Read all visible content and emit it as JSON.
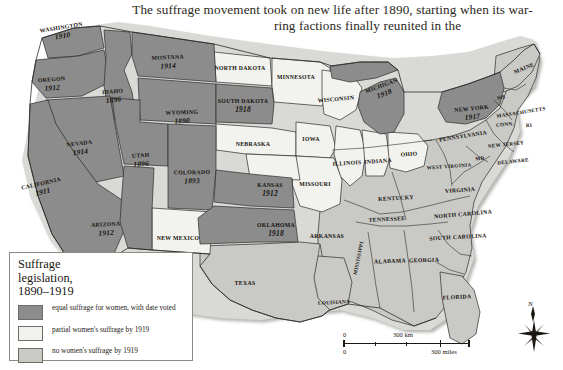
{
  "page": {
    "body_text_line1": "The suffrage movement took on new life after 1890, starting when its war-",
    "body_text_line2": "ring factions finally reunited in the"
  },
  "legend": {
    "title_line1": "Suffrage",
    "title_line2": "legislation,",
    "title_line3": "1890–1919",
    "items": [
      {
        "label": "equal suffrage for women, with date voted",
        "color": "#8c8c8c"
      },
      {
        "label": "partial women's suffrage by 1919",
        "color": "#f2f2ee"
      },
      {
        "label": "no women's suffrage by 1919",
        "color": "#c9c9c6"
      }
    ]
  },
  "scale_bar": {
    "km_zero": "0",
    "km_max": "300 km",
    "miles_zero": "0",
    "miles_max": "300 miles"
  },
  "compass": {
    "north_label": "N"
  },
  "colors": {
    "equal_suffrage": "#8c8c8c",
    "partial_suffrage": "#f2f2ee",
    "no_suffrage": "#c9c9c6",
    "border": "#2b2b2b",
    "ocean": "#ffffff",
    "text": "#16120d"
  },
  "map": {
    "title": "Woman suffrage legislation by state, 1890-1919",
    "states": [
      {
        "name": "WASHINGTON",
        "year": "1910",
        "category": "equal",
        "x": 62,
        "y": 32,
        "rot": -9,
        "size": "sm"
      },
      {
        "name": "OREGON",
        "year": "1912",
        "category": "equal",
        "x": 52,
        "y": 84,
        "rot": -4,
        "size": "sm"
      },
      {
        "name": "IDAHO",
        "year": "1896",
        "category": "equal",
        "x": 113,
        "y": 96,
        "rot": -6,
        "size": "sm"
      },
      {
        "name": "MONTANA",
        "year": "1914",
        "category": "equal",
        "x": 168,
        "y": 62,
        "rot": -3,
        "size": "sm"
      },
      {
        "name": "WYOMING",
        "year": "1890",
        "category": "equal",
        "x": 182,
        "y": 117,
        "rot": -2,
        "size": "sm"
      },
      {
        "name": "NEVADA",
        "year": "1914",
        "category": "equal",
        "x": 80,
        "y": 148,
        "rot": -7,
        "size": "sm"
      },
      {
        "name": "UTAH",
        "year": "1896",
        "category": "equal",
        "x": 141,
        "y": 160,
        "rot": -3,
        "size": "sm"
      },
      {
        "name": "CALIFORNIA",
        "year": "1911",
        "category": "equal",
        "x": 42,
        "y": 188,
        "rot": -13,
        "size": "sm"
      },
      {
        "name": "ARIZONA",
        "year": "1912",
        "category": "equal",
        "x": 106,
        "y": 229,
        "rot": -3,
        "size": "sm"
      },
      {
        "name": "COLORADO",
        "year": "1893",
        "category": "equal",
        "x": 192,
        "y": 177,
        "rot": -1,
        "size": "sm"
      },
      {
        "name": "SOUTH DAKOTA",
        "year": "1918",
        "category": "equal",
        "x": 243,
        "y": 106,
        "rot": 0,
        "size": "sm"
      },
      {
        "name": "KANSAS",
        "year": "1912",
        "category": "equal",
        "x": 270,
        "y": 190,
        "rot": 0,
        "size": "sm"
      },
      {
        "name": "OKLAHOMA",
        "year": "1918",
        "category": "equal",
        "x": 276,
        "y": 230,
        "rot": 0,
        "size": "sm"
      },
      {
        "name": "MICHIGAN",
        "year": "1918",
        "category": "equal",
        "x": 383,
        "y": 90,
        "rot": -20,
        "size": "sm"
      },
      {
        "name": "NEW YORK",
        "year": "1917",
        "category": "equal",
        "x": 472,
        "y": 113,
        "rot": -6,
        "size": "sm"
      },
      {
        "name": "NORTH DAKOTA",
        "year": "",
        "category": "partial",
        "x": 240,
        "y": 68,
        "rot": 0,
        "size": "sm"
      },
      {
        "name": "MINNESOTA",
        "year": "",
        "category": "partial",
        "x": 296,
        "y": 77,
        "rot": 0,
        "size": "sm"
      },
      {
        "name": "WISCONSIN",
        "year": "",
        "category": "partial",
        "x": 336,
        "y": 99,
        "rot": -5,
        "size": "sm"
      },
      {
        "name": "NEBRASKA",
        "year": "",
        "category": "partial",
        "x": 253,
        "y": 144,
        "rot": 0,
        "size": "sm"
      },
      {
        "name": "IOWA",
        "year": "",
        "category": "partial",
        "x": 311,
        "y": 139,
        "rot": 0,
        "size": "sm"
      },
      {
        "name": "ILLINOIS",
        "year": "",
        "category": "partial",
        "x": 347,
        "y": 163,
        "rot": -4,
        "size": "sm"
      },
      {
        "name": "INDIANA",
        "year": "",
        "category": "partial",
        "x": 378,
        "y": 161,
        "rot": -4,
        "size": "sm"
      },
      {
        "name": "OHIO",
        "year": "",
        "category": "partial",
        "x": 409,
        "y": 154,
        "rot": -4,
        "size": "sm"
      },
      {
        "name": "MISSOURI",
        "year": "",
        "category": "partial",
        "x": 315,
        "y": 184,
        "rot": 0,
        "size": "sm"
      },
      {
        "name": "NEW MEXICO",
        "year": "",
        "category": "partial",
        "x": 178,
        "y": 238,
        "rot": 0,
        "size": "sm"
      },
      {
        "name": "MAINE",
        "year": "",
        "category": "no",
        "x": 524,
        "y": 68,
        "rot": -22,
        "size": "sm"
      },
      {
        "name": "NH",
        "year": "",
        "category": "no",
        "x": 501,
        "y": 97,
        "rot": -15,
        "size": "xs"
      },
      {
        "name": "MASSACHUSETTS",
        "year": "",
        "category": "no",
        "x": 521,
        "y": 112,
        "rot": -9,
        "size": "xs"
      },
      {
        "name": "CONN.",
        "year": "",
        "category": "no",
        "x": 505,
        "y": 124,
        "rot": -6,
        "size": "xs"
      },
      {
        "name": "RI",
        "year": "",
        "category": "no",
        "x": 529,
        "y": 125,
        "rot": -6,
        "size": "xs"
      },
      {
        "name": "PENNSYLVANIA",
        "year": "",
        "category": "no",
        "x": 463,
        "y": 136,
        "rot": -9,
        "size": "sm"
      },
      {
        "name": "NEW JERSEY",
        "year": "",
        "category": "no",
        "x": 506,
        "y": 144,
        "rot": -6,
        "size": "xs"
      },
      {
        "name": "MD",
        "year": "",
        "category": "no",
        "x": 480,
        "y": 158,
        "rot": -6,
        "size": "xs"
      },
      {
        "name": "DELAWARE",
        "year": "",
        "category": "no",
        "x": 513,
        "y": 161,
        "rot": -6,
        "size": "xs"
      },
      {
        "name": "WEST VIRGINIA",
        "year": "",
        "category": "no",
        "x": 449,
        "y": 166,
        "rot": -4,
        "size": "xs"
      },
      {
        "name": "VIRGINIA",
        "year": "",
        "category": "no",
        "x": 460,
        "y": 190,
        "rot": -4,
        "size": "sm"
      },
      {
        "name": "KENTUCKY",
        "year": "",
        "category": "no",
        "x": 396,
        "y": 198,
        "rot": -3,
        "size": "sm"
      },
      {
        "name": "TENNESSEE",
        "year": "",
        "category": "no",
        "x": 387,
        "y": 219,
        "rot": -3,
        "size": "sm"
      },
      {
        "name": "NORTH CAROLINA",
        "year": "",
        "category": "no",
        "x": 463,
        "y": 214,
        "rot": -5,
        "size": "sm"
      },
      {
        "name": "SOUTH CAROLINA",
        "year": "",
        "category": "no",
        "x": 458,
        "y": 237,
        "rot": -3,
        "size": "sm"
      },
      {
        "name": "GEORGIA",
        "year": "",
        "category": "no",
        "x": 424,
        "y": 260,
        "rot": -2,
        "size": "sm"
      },
      {
        "name": "ALABAMA",
        "year": "",
        "category": "no",
        "x": 390,
        "y": 261,
        "rot": -2,
        "size": "sm"
      },
      {
        "name": "MISSISSIPPI",
        "year": "",
        "category": "no",
        "x": 358,
        "y": 258,
        "rot": -78,
        "size": "xs"
      },
      {
        "name": "ARKANSAS",
        "year": "",
        "category": "no",
        "x": 327,
        "y": 236,
        "rot": 0,
        "size": "sm"
      },
      {
        "name": "LOUISIANA",
        "year": "",
        "category": "no",
        "x": 334,
        "y": 302,
        "rot": -3,
        "size": "xs"
      },
      {
        "name": "TEXAS",
        "year": "",
        "category": "no",
        "x": 245,
        "y": 283,
        "rot": 0,
        "size": "sm"
      },
      {
        "name": "FLORIDA",
        "year": "",
        "category": "no",
        "x": 457,
        "y": 297,
        "rot": -3,
        "size": "sm"
      }
    ]
  }
}
